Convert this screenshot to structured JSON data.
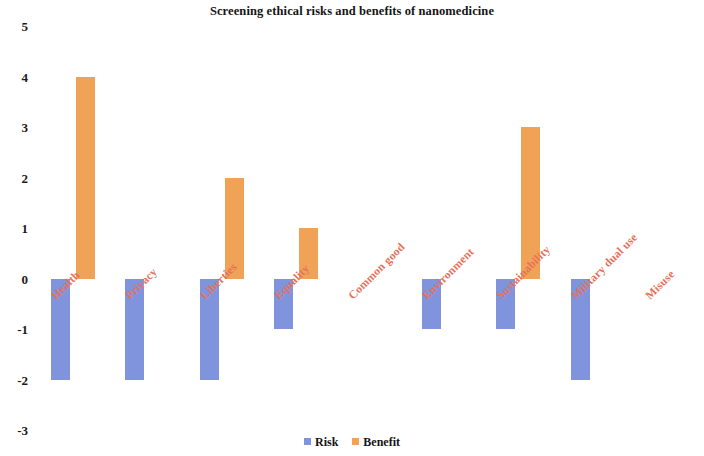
{
  "chart_data": {
    "type": "bar",
    "title": "Screening ethical risks and benefits of nanomedicine",
    "xlabel": "",
    "ylabel": "",
    "ylim": [
      -3,
      5
    ],
    "y_ticks": [
      5,
      4,
      3,
      2,
      1,
      0,
      -1,
      -2,
      -3
    ],
    "grid": false,
    "legend_position": "bottom",
    "categories": [
      "Health",
      "Privacy",
      "Liberties",
      "Equality",
      "Common good",
      "Environment",
      "Sustainability",
      "Military dual use",
      "Misuse"
    ],
    "series": [
      {
        "name": "Risk",
        "color": "#8094dd",
        "values": [
          -2,
          -2,
          -2,
          -1,
          0,
          -1,
          -1,
          -2,
          0
        ]
      },
      {
        "name": "Benefit",
        "color": "#f0a256",
        "values": [
          4,
          0,
          2,
          1,
          0,
          0,
          3,
          0,
          0
        ]
      }
    ]
  },
  "legend": {
    "entries": [
      {
        "label": "Risk",
        "color": "#8094dd"
      },
      {
        "label": "Benefit",
        "color": "#f0a256"
      }
    ]
  }
}
